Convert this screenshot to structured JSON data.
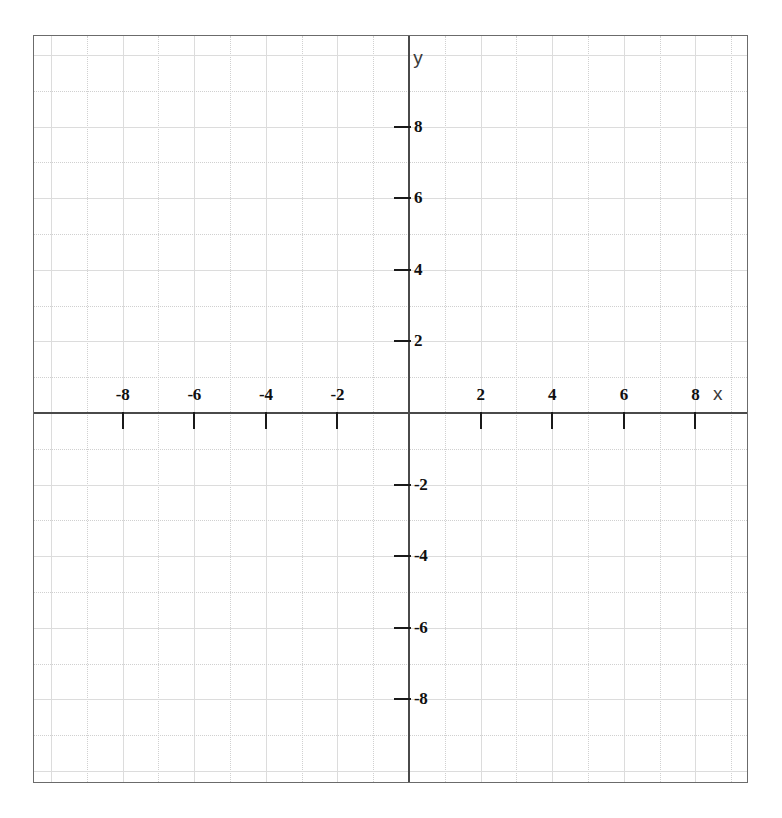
{
  "figure": {
    "kind": "blank-cartesian-coordinate-grid",
    "background_color": "#ffffff",
    "frame_border_color": "#6b6b6b",
    "grid_color": "#dcdcdc",
    "axis_color": "#4a4a4a",
    "tick_color": "#1a1a1a",
    "label_color": "#101010"
  },
  "axes": {
    "x_axis_name": "x",
    "y_axis_name": "y"
  },
  "chart_data": {
    "type": "scatter",
    "title": "",
    "subtitle": "",
    "xlabel": "x",
    "ylabel": "y",
    "series": [],
    "annotations": [],
    "legend": null,
    "legend_position": "none",
    "grid": true,
    "grid_step": 1,
    "tick_step": 2,
    "xlim": [
      -10.5,
      9.5
    ],
    "ylim": [
      -10.4,
      10.5
    ],
    "x_ticks": [
      -8,
      -6,
      -4,
      -2,
      2,
      4,
      6,
      8
    ],
    "y_ticks": [
      -8,
      -6,
      -4,
      -2,
      2,
      4,
      6,
      8
    ],
    "x_tick_labels": [
      "-8",
      "-6",
      "-4",
      "-2",
      "2",
      "4",
      "6",
      "8"
    ],
    "y_tick_labels": [
      "-8",
      "-6",
      "-4",
      "-2",
      "2",
      "4",
      "6",
      "8"
    ],
    "origin_labeled": false,
    "values": [],
    "categories": []
  }
}
